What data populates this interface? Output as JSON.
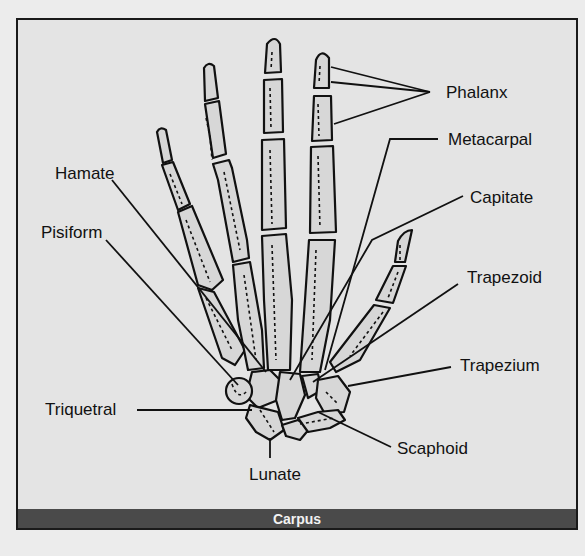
{
  "diagram": {
    "type": "anatomical-labeled-illustration",
    "caption": "Carpus",
    "labels": [
      {
        "id": "phalanx",
        "text": "Phalanx",
        "x": 446,
        "y": 88
      },
      {
        "id": "metacarpal",
        "text": "Metacarpal",
        "x": 448,
        "y": 130
      },
      {
        "id": "capitate",
        "text": "Capitate",
        "x": 470,
        "y": 188
      },
      {
        "id": "hamate",
        "text": "Hamate",
        "x": 55,
        "y": 163
      },
      {
        "id": "pisiform",
        "text": "Pisiform",
        "x": 41,
        "y": 221
      },
      {
        "id": "trapezoid",
        "text": "Trapezoid",
        "x": 467,
        "y": 266
      },
      {
        "id": "trapezium",
        "text": "Trapezium",
        "x": 460,
        "y": 356
      },
      {
        "id": "triquetral",
        "text": "Triquetral",
        "x": 45,
        "y": 399
      },
      {
        "id": "scaphoid",
        "text": "Scaphoid",
        "x": 397,
        "y": 440
      },
      {
        "id": "lunate",
        "text": "Lunate",
        "x": 249,
        "y": 464
      }
    ],
    "colors": {
      "frame_border": "#1a1a1a",
      "frame_fill": "#e4e4e4",
      "bone_fill": "#d7d7d7",
      "bone_stroke": "#111111",
      "caption_bar": "#4a4a4a",
      "caption_text": "#f2f2f2"
    }
  }
}
